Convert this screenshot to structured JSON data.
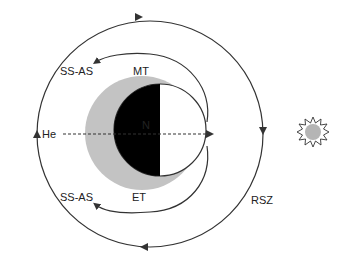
{
  "labels": {
    "ss_as_top": "SS-AS",
    "mt": "MT",
    "he": "He",
    "n": "N",
    "ss_as_bottom": "SS-AS",
    "et": "ET",
    "rsz": "RSZ"
  },
  "colors": {
    "line": "#333333",
    "shadow": "#c3c3c3",
    "night": "#000000",
    "day": "#ffffff",
    "sun_fill": "#b5b5b5"
  },
  "icons": {
    "sun": "sun-icon"
  }
}
